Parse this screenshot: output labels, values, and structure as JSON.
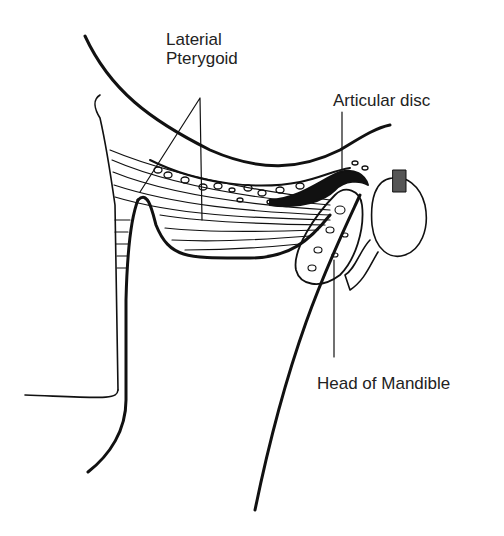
{
  "diagram": {
    "labels": {
      "lateral_pterygoid_line1": "Laterial",
      "lateral_pterygoid_line2": "Pterygoid",
      "articular_disc": "Articular disc",
      "head_of_mandible": "Head of Mandible"
    },
    "colors": {
      "line": "#111111",
      "text": "#222222",
      "background": "#ffffff"
    }
  }
}
